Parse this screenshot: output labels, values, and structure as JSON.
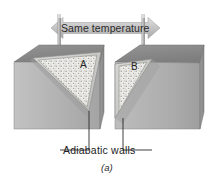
{
  "figure": {
    "id_label": "(a)",
    "banner_label": "Same temperature",
    "caption": "Adiabatic walls",
    "block_a_label": "A",
    "block_b_label": "B",
    "colors": {
      "background": "#ffffff",
      "block_top": "#8d8d8d",
      "block_front": "#b3b3b3",
      "block_side": "#9a9a9a",
      "wedge_fill": "#e8e8e6",
      "wedge_rim": "#c9c9c7",
      "banner_fill": "#c8c8c8",
      "rod": "#a0a0a0",
      "line": "#2b2b2b",
      "text": "#1a1a1a"
    }
  },
  "icons": {
    "arrow_left_head": "arrow-left-icon",
    "arrow_right_head": "arrow-right-icon",
    "thermometer_left": "thermometer-icon",
    "thermometer_right": "thermometer-icon"
  }
}
